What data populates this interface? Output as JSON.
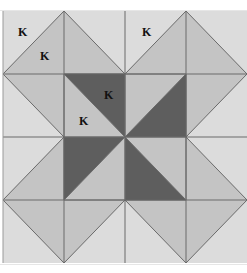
{
  "quilt": {
    "grid": {
      "x0": 3,
      "y0": 11,
      "cell_w": 61,
      "cell_h": 63,
      "cols": 4,
      "rows": 4
    },
    "colors": {
      "background": "#dcdcdc",
      "medium": "#c4c4c4",
      "dark": "#5e5e5e",
      "line": "#6a6a6a",
      "border_top": "#f3f3f3"
    },
    "labels": [
      {
        "text": "K",
        "x": 18,
        "y": 36
      },
      {
        "text": "K",
        "x": 40,
        "y": 60
      },
      {
        "text": "K",
        "x": 142,
        "y": 36
      },
      {
        "text": "K",
        "x": 104,
        "y": 99
      },
      {
        "text": "K",
        "x": 79,
        "y": 125
      }
    ]
  }
}
